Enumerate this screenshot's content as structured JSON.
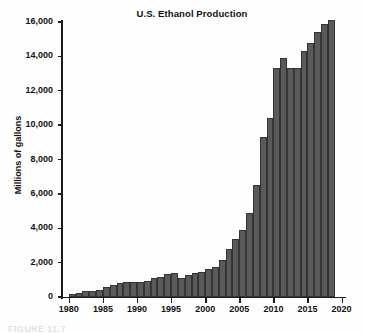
{
  "chart_data": {
    "type": "bar",
    "title": "U.S. Ethanol Production",
    "xlabel": "",
    "ylabel": "Millions of gallons",
    "xlim": [
      1979,
      2020.5
    ],
    "ylim": [
      0,
      16000
    ],
    "ytick_labels": [
      "0",
      "2,000",
      "4,000",
      "6,000",
      "8,000",
      "10,000",
      "12,000",
      "14,000",
      "16,000"
    ],
    "ytick_values": [
      0,
      2000,
      4000,
      6000,
      8000,
      10000,
      12000,
      14000,
      16000
    ],
    "xtick_labels": [
      "1980",
      "1985",
      "1990",
      "1995",
      "2000",
      "2005",
      "2010",
      "2015",
      "2020"
    ],
    "xtick_values": [
      1980,
      1985,
      1990,
      1995,
      2000,
      2005,
      2010,
      2015,
      2020
    ],
    "grid": false,
    "legend": false,
    "bar_color": "#5a5a5a",
    "bar_edge_color": "#343434",
    "background_color": "#ffffff",
    "categories": [
      1980,
      1981,
      1982,
      1983,
      1984,
      1985,
      1986,
      1987,
      1988,
      1989,
      1990,
      1991,
      1992,
      1993,
      1994,
      1995,
      1996,
      1997,
      1998,
      1999,
      2000,
      2001,
      2002,
      2003,
      2004,
      2005,
      2006,
      2007,
      2008,
      2009,
      2010,
      2011,
      2012,
      2013,
      2014,
      2015,
      2016,
      2017,
      2018
    ],
    "values": [
      175,
      215,
      350,
      375,
      430,
      610,
      710,
      830,
      845,
      870,
      900,
      950,
      1100,
      1150,
      1350,
      1400,
      1100,
      1300,
      1400,
      1470,
      1630,
      1770,
      2130,
      2800,
      3400,
      3900,
      4900,
      6500,
      9300,
      10400,
      13300,
      13900,
      13300,
      13300,
      14300,
      14800,
      15400,
      15900,
      16100
    ]
  },
  "caption": "FIGURE 11.7"
}
